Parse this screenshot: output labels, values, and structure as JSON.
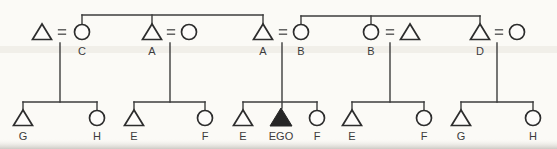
{
  "figure": {
    "type": "kinship-diagram",
    "canvas": {
      "width": 557,
      "height": 149
    },
    "equals_sign": "=",
    "colors": {
      "background": "#fbfaf6",
      "paper_fill": "#fdfcfa",
      "line": "#3d3d3d",
      "symbol_stroke": "#2d2d2d",
      "ego_fill": "#262626",
      "label": "#3b3b3b",
      "equals": "#4a4a4a",
      "scan_band": "#e8e3dc",
      "scan_bottom_from": "#f5f3ef",
      "scan_bottom_to": "#c8c5bf"
    },
    "parent_generation": {
      "symbol_y": 32,
      "label_y": 51,
      "sibling_lines": [
        {
          "y": 15,
          "x1": 82,
          "x2": 263,
          "drop_xs": [
            82,
            152,
            263
          ],
          "drop_to": 25
        },
        {
          "y": 16,
          "x1": 301,
          "x2": 480,
          "drop_xs": [
            301,
            371,
            480
          ],
          "drop_to": 25
        }
      ],
      "couples": [
        {
          "left": {
            "shape": "triangle",
            "x": 42,
            "label": ""
          },
          "equals_x": 62,
          "right": {
            "shape": "circle",
            "x": 82,
            "label": "C"
          },
          "descent_x": 60
        },
        {
          "left": {
            "shape": "triangle",
            "x": 152,
            "label": "A"
          },
          "equals_x": 171,
          "right": {
            "shape": "circle",
            "x": 189,
            "label": ""
          },
          "descent_x": 170
        },
        {
          "left": {
            "shape": "triangle",
            "x": 263,
            "label": "A"
          },
          "equals_x": 283,
          "right": {
            "shape": "circle",
            "x": 301,
            "label": "B"
          },
          "descent_x": 282
        },
        {
          "left": {
            "shape": "circle",
            "x": 371,
            "label": "B"
          },
          "equals_x": 390,
          "right": {
            "shape": "triangle",
            "x": 410,
            "label": ""
          },
          "descent_x": 390
        },
        {
          "left": {
            "shape": "triangle",
            "x": 480,
            "label": "D"
          },
          "equals_x": 499,
          "right": {
            "shape": "circle",
            "x": 517,
            "label": ""
          },
          "descent_x": 497
        }
      ]
    },
    "child_generation": {
      "descent_top_y": 43,
      "bar_y": 102,
      "drop_to": 111,
      "symbol_y": 118,
      "label_y": 136,
      "families": [
        {
          "bar_x1": 23,
          "bar_x2": 97,
          "children": [
            {
              "shape": "triangle",
              "x": 23,
              "label": "G"
            },
            {
              "shape": "circle",
              "x": 97,
              "label": "H"
            }
          ]
        },
        {
          "bar_x1": 134,
          "bar_x2": 205,
          "children": [
            {
              "shape": "triangle",
              "x": 134,
              "label": "E"
            },
            {
              "shape": "circle",
              "x": 205,
              "label": "F"
            }
          ]
        },
        {
          "bar_x1": 243,
          "bar_x2": 317,
          "ego_family": true,
          "children": [
            {
              "shape": "triangle",
              "x": 243,
              "label": "E"
            },
            {
              "shape": "triangle-filled",
              "x": 281,
              "label": "EGO",
              "on_descent": true
            },
            {
              "shape": "circle",
              "x": 317,
              "label": "F"
            }
          ]
        },
        {
          "bar_x1": 352,
          "bar_x2": 424,
          "children": [
            {
              "shape": "triangle",
              "x": 352,
              "label": "E"
            },
            {
              "shape": "circle",
              "x": 424,
              "label": "F"
            }
          ]
        },
        {
          "bar_x1": 461,
          "bar_x2": 533,
          "children": [
            {
              "shape": "triangle",
              "x": 461,
              "label": "G"
            },
            {
              "shape": "circle",
              "x": 533,
              "label": "H"
            }
          ]
        }
      ]
    },
    "scan_artifacts": {
      "mid_band": {
        "y": 46,
        "height": 7
      },
      "bottom_band": {
        "y": 139,
        "height": 10
      }
    }
  }
}
